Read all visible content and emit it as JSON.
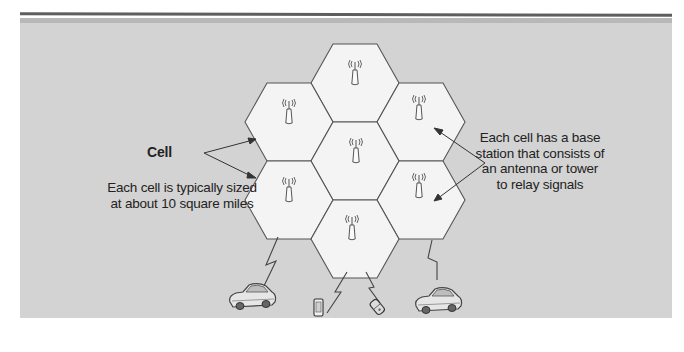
{
  "diagram": {
    "labels": {
      "cell": "Cell",
      "cell_size": "Each cell is typically sized at about 10 square miles",
      "base_station": "Each cell has a base station that consists of an antenna or tower to relay signals"
    },
    "cells": [
      {
        "id": "top",
        "cx": 355,
        "cy": 83
      },
      {
        "id": "upper-left",
        "cx": 289,
        "cy": 122
      },
      {
        "id": "upper-right",
        "cx": 421,
        "cy": 122
      },
      {
        "id": "center",
        "cx": 355,
        "cy": 161
      },
      {
        "id": "lower-left",
        "cx": 289,
        "cy": 200
      },
      {
        "id": "lower-right",
        "cx": 421,
        "cy": 200
      },
      {
        "id": "bottom",
        "cx": 355,
        "cy": 239
      }
    ],
    "devices": [
      {
        "type": "car",
        "position": "left"
      },
      {
        "type": "smartphone",
        "position": "center-left"
      },
      {
        "type": "flip-phone",
        "position": "center-right"
      },
      {
        "type": "car",
        "position": "right"
      }
    ],
    "colors": {
      "background": "#d3d3d3",
      "cell_fill": "#f4f4f4",
      "stroke": "#555555",
      "text": "#222222"
    }
  }
}
